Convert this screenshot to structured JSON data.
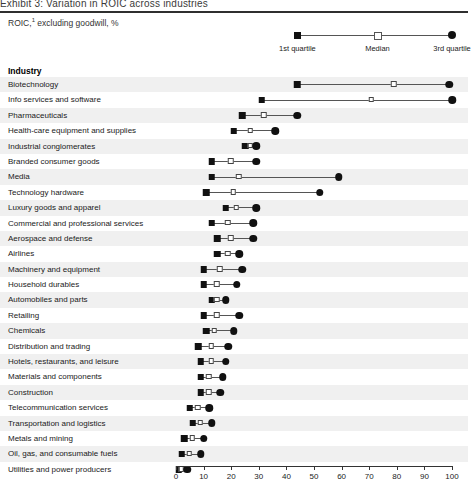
{
  "header": {
    "title_fragment": "Exhibit 3:  Variation in ROIC across industries",
    "subtitle": "ROIC,1 excluding goodwill, %"
  },
  "legend": {
    "items": [
      {
        "name": "first-quartile",
        "label": "1st quartile",
        "marker": "square",
        "value": 44
      },
      {
        "name": "median",
        "label": "Median",
        "marker": "open-square",
        "value": 73
      },
      {
        "name": "third-quartile",
        "label": "3rd quartile",
        "marker": "circle",
        "value": 100
      }
    ]
  },
  "column_header": "Industry",
  "chart_data": {
    "type": "dot-plot",
    "xlabel": "",
    "ylabel": "Industry",
    "xlim": [
      0,
      100
    ],
    "xticks": [
      0,
      10,
      20,
      30,
      40,
      50,
      60,
      70,
      80,
      90,
      100
    ],
    "grid": false,
    "legend_position": "top-right",
    "series": [
      {
        "name": "1st quartile",
        "marker": "filled-square"
      },
      {
        "name": "Median",
        "marker": "open-square"
      },
      {
        "name": "3rd quartile",
        "marker": "filled-circle"
      }
    ],
    "categories": [
      "Biotechnology",
      "Info services and software",
      "Pharmaceuticals",
      "Health-care equipment and supplies",
      "Industrial conglomerates",
      "Branded consumer goods",
      "Media",
      "Technology hardware",
      "Luxury goods and apparel",
      "Commercial and professional services",
      "Aerospace and defense",
      "Airlines",
      "Machinery and equipment",
      "Household durables",
      "Automobiles and parts",
      "Retailing",
      "Chemicals",
      "Distribution and trading",
      "Hotels, restaurants, and leisure",
      "Materials and components",
      "Construction",
      "Telecommunication services",
      "Transportation and logistics",
      "Metals and mining",
      "Oil, gas, and consumable fuels",
      "Utilities and power producers"
    ],
    "rows": [
      {
        "industry": "Biotechnology",
        "q1": 44,
        "median": 79,
        "q3": 99
      },
      {
        "industry": "Info services and software",
        "q1": 31,
        "median": 71,
        "q3": 100
      },
      {
        "industry": "Pharmaceuticals",
        "q1": 24,
        "median": 32,
        "q3": 44
      },
      {
        "industry": "Health-care equipment and supplies",
        "q1": 21,
        "median": 27,
        "q3": 36
      },
      {
        "industry": "Industrial conglomerates",
        "q1": 25,
        "median": 27,
        "q3": 29
      },
      {
        "industry": "Branded consumer goods",
        "q1": 13,
        "median": 20,
        "q3": 29
      },
      {
        "industry": "Media",
        "q1": 13,
        "median": 23,
        "q3": 59
      },
      {
        "industry": "Technology hardware",
        "q1": 11,
        "median": 21,
        "q3": 52
      },
      {
        "industry": "Luxury goods and apparel",
        "q1": 18,
        "median": 22,
        "q3": 29
      },
      {
        "industry": "Commercial and professional services",
        "q1": 13,
        "median": 19,
        "q3": 28
      },
      {
        "industry": "Aerospace and defense",
        "q1": 15,
        "median": 20,
        "q3": 28
      },
      {
        "industry": "Airlines",
        "q1": 15,
        "median": 19,
        "q3": 23
      },
      {
        "industry": "Machinery and equipment",
        "q1": 10,
        "median": 16,
        "q3": 24
      },
      {
        "industry": "Household durables",
        "q1": 10,
        "median": 15,
        "q3": 22
      },
      {
        "industry": "Automobiles and parts",
        "q1": 13,
        "median": 15,
        "q3": 18
      },
      {
        "industry": "Retailing",
        "q1": 10,
        "median": 15,
        "q3": 23
      },
      {
        "industry": "Chemicals",
        "q1": 11,
        "median": 14,
        "q3": 21
      },
      {
        "industry": "Distribution and trading",
        "q1": 8,
        "median": 13,
        "q3": 19
      },
      {
        "industry": "Hotels, restaurants, and leisure",
        "q1": 9,
        "median": 13,
        "q3": 18
      },
      {
        "industry": "Materials and components",
        "q1": 9,
        "median": 12,
        "q3": 17
      },
      {
        "industry": "Construction",
        "q1": 9,
        "median": 12,
        "q3": 16
      },
      {
        "industry": "Telecommunication services",
        "q1": 5,
        "median": 8,
        "q3": 12
      },
      {
        "industry": "Transportation and logistics",
        "q1": 6,
        "median": 9,
        "q3": 13
      },
      {
        "industry": "Metals and mining",
        "q1": 3,
        "median": 6,
        "q3": 10
      },
      {
        "industry": "Oil, gas, and consumable fuels",
        "q1": 2,
        "median": 5,
        "q3": 9
      },
      {
        "industry": "Utilities and power producers",
        "q1": 1,
        "median": 2,
        "q3": 4
      }
    ]
  },
  "axis": {
    "ticks": [
      "0",
      "10",
      "20",
      "30",
      "40",
      "50",
      "60",
      "70",
      "80",
      "90",
      "100"
    ]
  }
}
